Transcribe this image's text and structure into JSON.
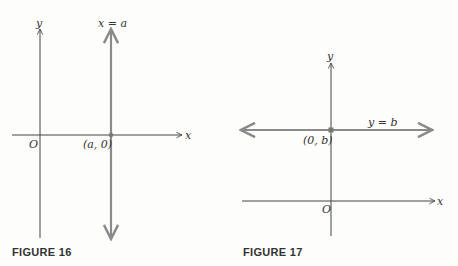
{
  "figures": [
    {
      "caption": "FIGURE 16",
      "axes": {
        "x_label": "x",
        "y_label": "y",
        "origin_label": "O"
      },
      "line": {
        "equation": "x = a",
        "orientation": "vertical"
      },
      "point": {
        "label": "(a, 0)"
      }
    },
    {
      "caption": "FIGURE 17",
      "axes": {
        "x_label": "x",
        "y_label": "y",
        "origin_label": "O"
      },
      "line": {
        "equation": "y = b",
        "orientation": "horizontal"
      },
      "point": {
        "label": "(0, b)"
      }
    }
  ],
  "colors": {
    "axis": "#444444",
    "highlight_line": "#8a8a8a",
    "point": "#777777",
    "text": "#333333"
  }
}
